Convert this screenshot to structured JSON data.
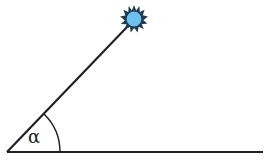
{
  "diagram": {
    "angle_label": "α",
    "elements": [
      "ground-line",
      "sun-ray-line",
      "sun",
      "angle-arc"
    ],
    "colors": {
      "line": "#222222",
      "sun_fill": "#6ec1ef",
      "sun_spikes": "#1f3a52"
    }
  }
}
